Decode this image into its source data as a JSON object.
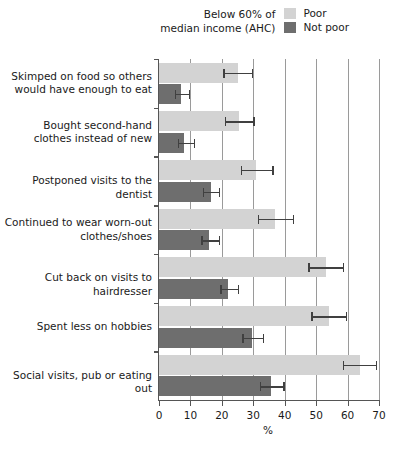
{
  "legend": {
    "note_line1": "Below 60% of",
    "note_line2": "median income (AHC)",
    "items": [
      {
        "label": "Poor",
        "color": "#d3d3d3"
      },
      {
        "label": "Not poor",
        "color": "#6e6e6e"
      }
    ]
  },
  "chart_data": {
    "type": "bar",
    "orientation": "horizontal",
    "title": "",
    "xlabel": "%",
    "ylabel": "",
    "xlim": [
      0,
      70
    ],
    "xticks": [
      0,
      10,
      20,
      30,
      40,
      50,
      60,
      70
    ],
    "xticklabels": [
      "0",
      "10",
      "20",
      "30",
      "40",
      "50",
      "60",
      "70"
    ],
    "grid": "vertical",
    "legend_position": "top-right",
    "categories": [
      "Skimped on food so others would have enough to eat",
      "Bought second-hand clothes instead of new",
      "Postponed visits to the dentist",
      "Continued to wear worn-out clothes/shoes",
      "Cut back on visits to hairdresser",
      "Spent less on hobbies",
      "Social visits, pub or eating out"
    ],
    "category_lines": [
      [
        "Skimped on food so others",
        "would have enough to eat"
      ],
      [
        "Bought second-hand",
        "clothes instead of new"
      ],
      [
        "Postponed visits to the dentist"
      ],
      [
        "Continued to wear worn-out",
        "clothes/shoes"
      ],
      [
        "Cut back on visits to hairdresser"
      ],
      [
        "Spent less on hobbies"
      ],
      [
        "Social visits, pub or eating out"
      ]
    ],
    "series": [
      {
        "name": "Poor",
        "color": "#d3d3d3",
        "values": [
          25,
          25.5,
          31,
          37,
          53,
          54,
          64
        ],
        "err_low": [
          20.5,
          21,
          26,
          31.5,
          47.5,
          48.5,
          58.5
        ],
        "err_high": [
          29.5,
          30,
          36,
          42.5,
          58.5,
          59.5,
          69
        ]
      },
      {
        "name": "Not poor",
        "color": "#6e6e6e",
        "values": [
          7,
          8,
          16.5,
          16,
          22,
          29.5,
          35.5
        ],
        "err_low": [
          5,
          6,
          14,
          13.5,
          19.5,
          26.5,
          32
        ],
        "err_high": [
          9.5,
          11,
          19,
          19,
          25,
          33,
          39.5
        ]
      }
    ]
  }
}
